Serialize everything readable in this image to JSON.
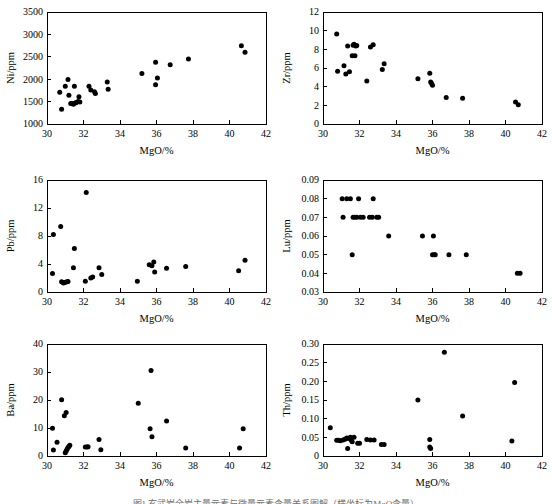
{
  "figure": {
    "caption": "图1  玄武岩全岩主量元素与微量元素含量关系图解（横坐标为MgO含量）",
    "panel_count": 6
  },
  "axis_common": {
    "xlabel": "MgO/%",
    "xticks": [
      30,
      32,
      34,
      36,
      38,
      40,
      42
    ],
    "xlim": [
      30,
      42
    ]
  },
  "chart_data": [
    {
      "id": "ni",
      "type": "scatter",
      "title": "",
      "xlabel": "MgO/%",
      "ylabel": "Ni/ppm",
      "xlim": [
        30,
        42
      ],
      "ylim": [
        1000,
        3500
      ],
      "xticks": [
        30,
        32,
        34,
        36,
        38,
        40,
        42
      ],
      "yticks": [
        1000,
        1500,
        2000,
        2500,
        3000,
        3500
      ],
      "ytick_labels": [
        "1000",
        "1500",
        "2000",
        "2500",
        "3000",
        "3500"
      ],
      "grid": false,
      "legend": "none",
      "points": [
        [
          30.7,
          1710
        ],
        [
          30.8,
          1330
        ],
        [
          31.0,
          1840
        ],
        [
          31.15,
          1995
        ],
        [
          31.2,
          1640
        ],
        [
          31.3,
          1460
        ],
        [
          31.4,
          1455
        ],
        [
          31.45,
          1440
        ],
        [
          31.5,
          1840
        ],
        [
          31.55,
          1470
        ],
        [
          31.6,
          1480
        ],
        [
          31.7,
          1500
        ],
        [
          31.75,
          1610
        ],
        [
          31.8,
          1490
        ],
        [
          32.3,
          1845
        ],
        [
          32.4,
          1760
        ],
        [
          32.6,
          1720
        ],
        [
          32.65,
          1680
        ],
        [
          33.3,
          1935
        ],
        [
          33.35,
          1775
        ],
        [
          35.2,
          2125
        ],
        [
          35.95,
          2380
        ],
        [
          35.95,
          1875
        ],
        [
          36.05,
          2025
        ],
        [
          36.75,
          2325
        ],
        [
          37.75,
          2450
        ],
        [
          40.65,
          2745
        ],
        [
          40.85,
          2600
        ]
      ]
    },
    {
      "id": "zr",
      "type": "scatter",
      "title": "",
      "xlabel": "MgO/%",
      "ylabel": "Zr/ppm",
      "xlim": [
        30,
        42
      ],
      "ylim": [
        0,
        12
      ],
      "xticks": [
        30,
        32,
        34,
        36,
        38,
        40,
        42
      ],
      "yticks": [
        0,
        2,
        4,
        6,
        8,
        10,
        12
      ],
      "ytick_labels": [
        "0",
        "2",
        "4",
        "6",
        "8",
        "10",
        "12"
      ],
      "grid": false,
      "legend": "none",
      "points": [
        [
          30.75,
          9.65
        ],
        [
          30.8,
          5.65
        ],
        [
          31.15,
          6.25
        ],
        [
          31.25,
          5.35
        ],
        [
          31.35,
          8.35
        ],
        [
          31.45,
          5.6
        ],
        [
          31.6,
          7.3
        ],
        [
          31.65,
          8.45
        ],
        [
          31.7,
          8.55
        ],
        [
          31.75,
          7.3
        ],
        [
          31.8,
          8.35
        ],
        [
          31.85,
          8.4
        ],
        [
          32.4,
          4.6
        ],
        [
          32.6,
          8.25
        ],
        [
          32.75,
          8.5
        ],
        [
          33.25,
          5.85
        ],
        [
          33.35,
          6.45
        ],
        [
          35.2,
          4.85
        ],
        [
          35.85,
          5.45
        ],
        [
          35.9,
          4.5
        ],
        [
          35.95,
          4.35
        ],
        [
          36.0,
          4.15
        ],
        [
          36.75,
          2.85
        ],
        [
          37.65,
          2.75
        ],
        [
          40.55,
          2.35
        ],
        [
          40.7,
          2.05
        ]
      ]
    },
    {
      "id": "pb",
      "type": "scatter",
      "title": "",
      "xlabel": "MgO/%",
      "ylabel": "Pb/ppm",
      "xlim": [
        30,
        42
      ],
      "ylim": [
        0,
        16
      ],
      "xticks": [
        30,
        32,
        34,
        36,
        38,
        40,
        42
      ],
      "yticks": [
        0,
        4,
        8,
        12,
        16
      ],
      "ytick_labels": [
        "0",
        "4",
        "8",
        "12",
        "16"
      ],
      "grid": false,
      "legend": "none",
      "points": [
        [
          30.3,
          2.65
        ],
        [
          30.35,
          8.2
        ],
        [
          30.75,
          9.35
        ],
        [
          30.8,
          1.45
        ],
        [
          30.9,
          1.3
        ],
        [
          30.95,
          1.35
        ],
        [
          31.0,
          1.4
        ],
        [
          31.1,
          1.45
        ],
        [
          31.15,
          1.5
        ],
        [
          31.45,
          3.45
        ],
        [
          31.5,
          6.2
        ],
        [
          32.15,
          14.2
        ],
        [
          32.1,
          1.55
        ],
        [
          32.4,
          2.0
        ],
        [
          32.5,
          2.15
        ],
        [
          32.85,
          3.45
        ],
        [
          33.0,
          2.5
        ],
        [
          34.95,
          1.55
        ],
        [
          35.6,
          3.9
        ],
        [
          35.75,
          3.75
        ],
        [
          35.85,
          4.3
        ],
        [
          35.9,
          2.85
        ],
        [
          36.55,
          3.4
        ],
        [
          37.6,
          3.65
        ],
        [
          40.5,
          3.05
        ],
        [
          40.85,
          4.55
        ]
      ]
    },
    {
      "id": "lu",
      "type": "scatter",
      "title": "",
      "xlabel": "MgO/%",
      "ylabel": "Lu/ppm",
      "xlim": [
        30,
        42
      ],
      "ylim": [
        0.03,
        0.09
      ],
      "xticks": [
        30,
        32,
        34,
        36,
        38,
        40,
        42
      ],
      "yticks": [
        0.03,
        0.04,
        0.05,
        0.06,
        0.07,
        0.08,
        0.09
      ],
      "ytick_labels": [
        "0.03",
        "0.04",
        "0.05",
        "0.06",
        "0.07",
        "0.08",
        "0.09"
      ],
      "grid": false,
      "legend": "none",
      "points": [
        [
          31.05,
          0.08
        ],
        [
          31.1,
          0.07
        ],
        [
          31.3,
          0.08
        ],
        [
          31.5,
          0.08
        ],
        [
          31.6,
          0.05
        ],
        [
          31.65,
          0.07
        ],
        [
          31.75,
          0.07
        ],
        [
          31.85,
          0.07
        ],
        [
          31.95,
          0.08
        ],
        [
          32.05,
          0.07
        ],
        [
          32.2,
          0.07
        ],
        [
          32.55,
          0.07
        ],
        [
          32.7,
          0.07
        ],
        [
          32.75,
          0.08
        ],
        [
          32.95,
          0.07
        ],
        [
          33.05,
          0.07
        ],
        [
          33.6,
          0.06
        ],
        [
          35.45,
          0.06
        ],
        [
          36.05,
          0.06
        ],
        [
          36.0,
          0.05
        ],
        [
          36.1,
          0.05
        ],
        [
          36.15,
          0.05
        ],
        [
          36.9,
          0.05
        ],
        [
          37.85,
          0.05
        ],
        [
          40.65,
          0.04
        ],
        [
          40.8,
          0.04
        ]
      ]
    },
    {
      "id": "ba",
      "type": "scatter",
      "title": "",
      "xlabel": "MgO/%",
      "ylabel": "Ba/ppm",
      "xlim": [
        30,
        42
      ],
      "ylim": [
        0,
        40
      ],
      "xticks": [
        30,
        32,
        34,
        36,
        38,
        40,
        42
      ],
      "yticks": [
        0,
        10,
        20,
        30,
        40
      ],
      "ytick_labels": [
        "0",
        "10",
        "20",
        "30",
        "40"
      ],
      "grid": false,
      "legend": "none",
      "points": [
        [
          30.3,
          9.9
        ],
        [
          30.35,
          2.1
        ],
        [
          30.55,
          4.9
        ],
        [
          30.8,
          20.1
        ],
        [
          30.95,
          14.4
        ],
        [
          31.05,
          15.5
        ],
        [
          31.0,
          1.2
        ],
        [
          31.05,
          1.8
        ],
        [
          31.1,
          2.4
        ],
        [
          31.15,
          3.0
        ],
        [
          31.2,
          3.4
        ],
        [
          31.25,
          3.8
        ],
        [
          32.1,
          3.2
        ],
        [
          32.2,
          3.2
        ],
        [
          32.25,
          3.3
        ],
        [
          32.85,
          5.9
        ],
        [
          32.95,
          2.2
        ],
        [
          35.0,
          18.8
        ],
        [
          35.7,
          30.5
        ],
        [
          35.65,
          9.7
        ],
        [
          35.75,
          6.9
        ],
        [
          36.55,
          12.5
        ],
        [
          37.6,
          2.9
        ],
        [
          40.55,
          2.9
        ],
        [
          40.75,
          9.7
        ]
      ]
    },
    {
      "id": "th",
      "type": "scatter",
      "title": "",
      "xlabel": "MgO/%",
      "ylabel": "Th/ppm",
      "xlim": [
        30,
        42
      ],
      "ylim": [
        0,
        0.3
      ],
      "xticks": [
        30,
        32,
        34,
        36,
        38,
        40,
        42
      ],
      "yticks": [
        0,
        0.05,
        0.1,
        0.15,
        0.2,
        0.25,
        0.3
      ],
      "ytick_labels": [
        "0",
        "0.05",
        "0.10",
        "0.15",
        "0.20",
        "0.25",
        "0.30"
      ],
      "grid": false,
      "legend": "none",
      "points": [
        [
          30.4,
          0.076
        ],
        [
          30.75,
          0.042
        ],
        [
          30.85,
          0.042
        ],
        [
          30.95,
          0.041
        ],
        [
          31.1,
          0.043
        ],
        [
          31.2,
          0.045
        ],
        [
          31.3,
          0.048
        ],
        [
          31.35,
          0.02
        ],
        [
          31.4,
          0.047
        ],
        [
          31.5,
          0.05
        ],
        [
          31.55,
          0.042
        ],
        [
          31.6,
          0.038
        ],
        [
          31.7,
          0.05
        ],
        [
          31.9,
          0.034
        ],
        [
          32.0,
          0.034
        ],
        [
          32.4,
          0.044
        ],
        [
          32.6,
          0.043
        ],
        [
          32.8,
          0.043
        ],
        [
          33.2,
          0.031
        ],
        [
          33.35,
          0.031
        ],
        [
          35.2,
          0.15
        ],
        [
          35.85,
          0.044
        ],
        [
          35.85,
          0.024
        ],
        [
          35.9,
          0.02
        ],
        [
          36.65,
          0.278
        ],
        [
          37.65,
          0.107
        ],
        [
          40.35,
          0.04
        ],
        [
          40.5,
          0.197
        ]
      ]
    }
  ]
}
